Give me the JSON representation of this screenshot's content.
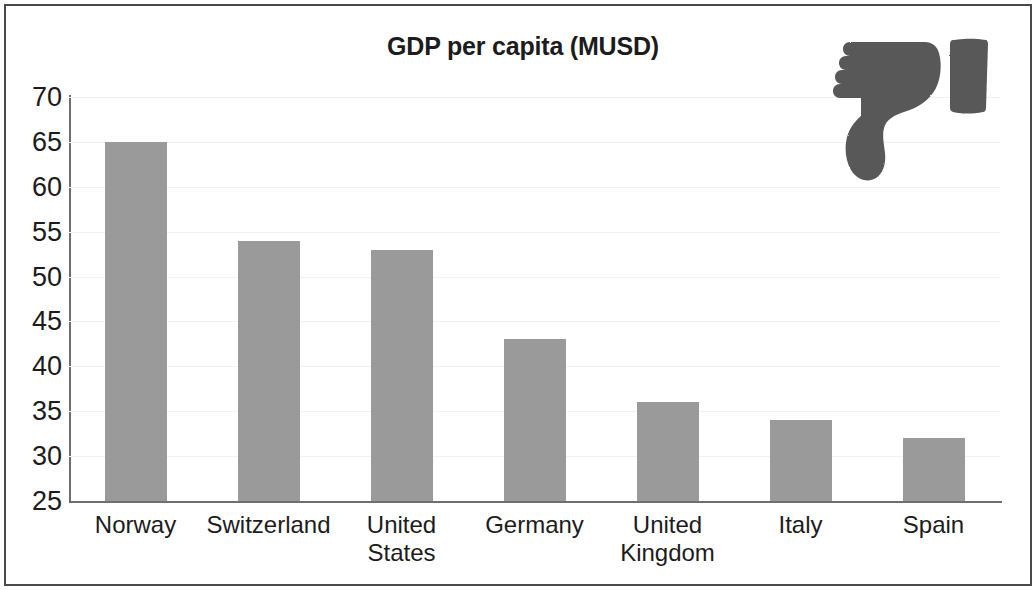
{
  "chart_data": {
    "type": "bar",
    "title": "GDP per capita (MUSD)",
    "xlabel": "",
    "ylabel": "",
    "ylim": [
      25,
      70
    ],
    "ytick_step": 5,
    "yticks": [
      "70",
      "65",
      "60",
      "55",
      "50",
      "45",
      "40",
      "35",
      "30",
      "25"
    ],
    "ytick_values": [
      70,
      65,
      60,
      55,
      50,
      45,
      40,
      35,
      30,
      25
    ],
    "grid": false,
    "legend": null,
    "legend_position": "none",
    "categories": [
      "Norway",
      "Switzerland",
      "United States",
      "Germany",
      "United Kingdom",
      "Italy",
      "Spain"
    ],
    "values": [
      65,
      54,
      53,
      43,
      36,
      34,
      32
    ],
    "series": [
      {
        "name": "GDP per capita (MUSD)",
        "values": [
          65,
          54,
          53,
          43,
          36,
          34,
          32
        ]
      }
    ],
    "bar_color": "#9a9a9a",
    "axis_color": "#6e6e6e",
    "text_color": "#1c1c1c",
    "background": "#ffffff"
  },
  "annotations": {
    "thumbs_down_icon": "thumbs-down-icon",
    "thumbs_down_color": "#585858"
  },
  "frame": {
    "border_color": "#4a4a4a"
  }
}
